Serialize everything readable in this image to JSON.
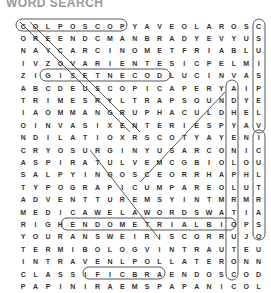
{
  "title": "WORD SEARCH",
  "grid": {
    "rows": [
      "COLPOSCOPYAVEOLAROSCOH",
      "OREENDCMANBRADYEVYUSQY",
      "NAYCARCINOMETFRIABLUJS",
      "IVZOVARIENTESICPELMIST",
      "ZIGISETNECODLUCINVASIE",
      "ABCDEUSCOPICAPERYAIPOR",
      "TRIMESRYLTRAPSOUNDYEAO",
      "IAOMMANGRUPHACULDHELPS",
      "OINVASIXENTERIESPYAVIA",
      "NDILATIOXRSCOTYAYENILL",
      "CRYOSURGINYUSARCONICUP",
      "ASPIRATULVEMCGBIOLOUGI",
      "SALPYINGOSCEORRHAPHLYN",
      "TYPOGRAPICUMPAREOLUTEG",
      "ADVENTTUREMSYINTMRMRLO",
      "MEDICAWELAWORDSWATIAUG",
      "RIGHENDOMETRIALBIOPSYR",
      "YOURANSWEIRISCORRUJOIA",
      "TERMIBOLOGVINTRAUTEURP",
      "INTRAVENLPOLLATERONNMH",
      "CLASSIFICBRAENDOSCODUY",
      "PAPINIRAEMSPAPANICOLAO"
    ]
  },
  "found_words": [
    "COLPOSCOPY",
    "ENDOMETRIALBIOPSY",
    "RAEMSPAP",
    "LUC",
    "GISE",
    "HYSTEROSALPINGOGRAPHY"
  ]
}
